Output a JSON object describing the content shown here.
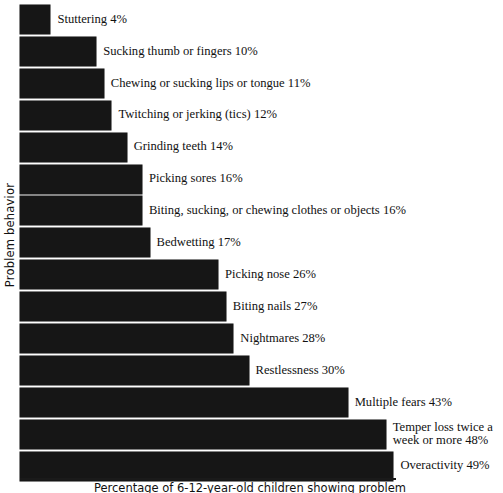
{
  "chart_data": {
    "type": "bar",
    "orientation": "horizontal",
    "title": "",
    "xlabel": "Percentage of 6-12-year-old children showing problem",
    "ylabel": "Problem behavior",
    "xlim": [
      0,
      50
    ],
    "grid": false,
    "legend": null,
    "bar_color": "#161616",
    "background_color": "#ffffff",
    "categories": [
      "Stuttering",
      "Sucking thumb or fingers",
      "Chewing or sucking lips or tongue",
      "Twitching or jerking (tics)",
      "Grinding teeth",
      "Picking sores",
      "Biting, sucking, or chewing clothes or objects",
      "Bedwetting",
      "Picking nose",
      "Biting nails",
      "Nightmares",
      "Restlessness",
      "Multiple fears",
      "Temper loss twice a week or more",
      "Overactivity"
    ],
    "values": [
      4,
      10,
      11,
      12,
      14,
      16,
      16,
      17,
      26,
      27,
      28,
      30,
      43,
      48,
      49
    ],
    "data_labels": [
      "Stuttering 4%",
      "Sucking thumb or fingers 10%",
      "Chewing or sucking lips or tongue 11%",
      "Twitching or jerking (tics) 12%",
      "Grinding teeth 14%",
      "Picking sores 16%",
      "Biting, sucking, or chewing clothes or objects 16%",
      "Bedwetting 17%",
      "Picking nose 26%",
      "Biting nails 27%",
      "Nightmares 28%",
      "Restlessness 30%",
      "Multiple fears 43%",
      "Temper loss twice a\nweek or more 48%",
      "Overactivity 49%"
    ]
  },
  "axes": {
    "y_title": "Problem behavior",
    "x_title": "Percentage of 6-12-year-old children showing problem"
  }
}
